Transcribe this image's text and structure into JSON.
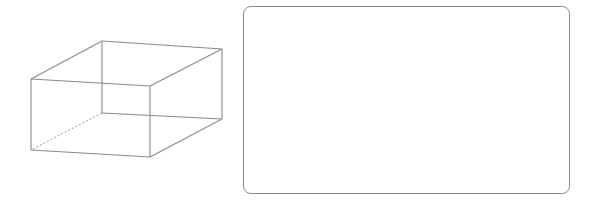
{
  "diagram": {
    "type": "cuboid-wireframe",
    "stroke_color": "#8a8a8a",
    "vertices": {
      "top_back_left": [
        102,
        41
      ],
      "top_back_right": [
        222,
        49
      ],
      "top_front_left": [
        31,
        79
      ],
      "top_front_right": [
        150,
        86
      ],
      "bottom_back_left": [
        102,
        113
      ],
      "bottom_back_right": [
        222,
        119
      ],
      "bottom_front_left": [
        31,
        150
      ],
      "bottom_front_right": [
        150,
        157
      ]
    },
    "hidden_edges": [
      [
        "bottom_back_left",
        "bottom_front_left"
      ]
    ]
  },
  "answer_box": {
    "x": 243,
    "y": 6,
    "width": 327,
    "height": 188,
    "content": ""
  }
}
